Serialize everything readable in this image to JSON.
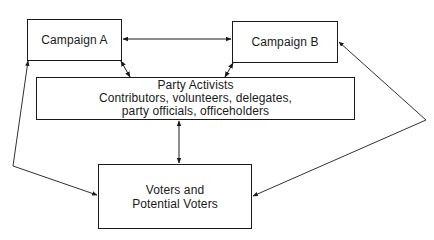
{
  "diagram": {
    "type": "flow",
    "nodes": [
      {
        "id": "campaign_a",
        "lines": [
          "Campaign A"
        ]
      },
      {
        "id": "campaign_b",
        "lines": [
          "Campaign B"
        ]
      },
      {
        "id": "party_activists",
        "lines": [
          "Party Activists",
          "Contributors, volunteers, delegates,",
          "party officials, officeholders"
        ]
      },
      {
        "id": "voters",
        "lines": [
          "Voters and",
          "Potential Voters"
        ]
      }
    ],
    "edges": [
      {
        "from": "campaign_a",
        "to": "campaign_b",
        "direction": "both"
      },
      {
        "from": "campaign_a",
        "to": "party_activists",
        "direction": "both"
      },
      {
        "from": "campaign_b",
        "to": "party_activists",
        "direction": "both"
      },
      {
        "from": "party_activists",
        "to": "voters",
        "direction": "both"
      },
      {
        "from": "campaign_a",
        "to": "voters",
        "direction": "both"
      },
      {
        "from": "campaign_b",
        "to": "voters",
        "direction": "both"
      }
    ],
    "colors": {
      "stroke": "#1a1a1a",
      "background": "#ffffff"
    }
  }
}
